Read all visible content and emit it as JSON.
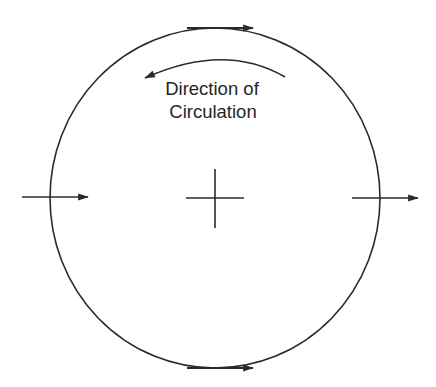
{
  "diagram": {
    "title": "",
    "label": {
      "line1": "Direction of",
      "line2": "Circulation"
    },
    "circle": {
      "cx": 215,
      "cy": 198,
      "rx": 165,
      "ry": 170
    },
    "center_mark": {
      "x": 215,
      "y": 198,
      "half_len": 29
    },
    "arrows": [
      {
        "id": "top-tangent-arrow",
        "direction": "right",
        "x1": 187,
        "x2": 253,
        "y": 28
      },
      {
        "id": "bottom-tangent-arrow",
        "direction": "right",
        "x1": 187,
        "x2": 253,
        "y": 368
      },
      {
        "id": "left-inflow-arrow",
        "direction": "right",
        "x1": 22,
        "x2": 88,
        "y": 197
      },
      {
        "id": "right-outflow-arrow",
        "direction": "right",
        "x1": 352,
        "x2": 418,
        "y": 198
      },
      {
        "id": "circulation-curved-arrow",
        "direction": "counter-clockwise"
      }
    ],
    "colors": {
      "stroke": "#2a2a2a",
      "text": "#262626",
      "background": "#ffffff"
    }
  }
}
